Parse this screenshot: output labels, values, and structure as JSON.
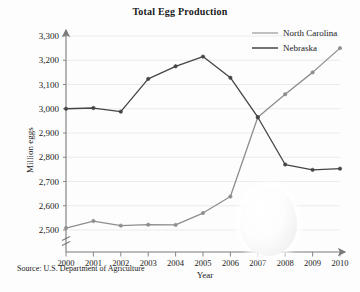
{
  "title": "Total Egg Production",
  "source_note": "Source: U.S. Department of Agriculture",
  "axes": {
    "xlabel": "Year",
    "ylabel": "Million eggs"
  },
  "legend": {
    "entries": [
      {
        "label": "North Carolina",
        "color": "#8e8e8e"
      },
      {
        "label": "Nebraska",
        "color": "#454545"
      }
    ]
  },
  "overlay": {
    "egg_shape": "egg-graphic"
  },
  "chart_data": {
    "type": "line",
    "title": "Total Egg Production",
    "xlabel": "Year",
    "ylabel": "Million eggs",
    "x": [
      2000,
      2001,
      2002,
      2003,
      2004,
      2005,
      2006,
      2007,
      2008,
      2009,
      2010
    ],
    "xtick_labels": [
      "2000",
      "2001",
      "2002",
      "2003",
      "2004",
      "2005",
      "2006",
      "2007",
      "2008",
      "2009",
      "2010"
    ],
    "ytick_labels": [
      "2,500",
      "2,600",
      "2,700",
      "2,800",
      "2,900",
      "3,000",
      "3,100",
      "3,200",
      "3,300"
    ],
    "yticks": [
      2500,
      2600,
      2700,
      2800,
      2900,
      3000,
      3100,
      3200,
      3300
    ],
    "ylim": [
      2500,
      3300
    ],
    "xlim": [
      2000,
      2010
    ],
    "axis_break": true,
    "grid": true,
    "legend_position": "top-right",
    "series": [
      {
        "name": "North Carolina",
        "color": "#8e8e8e",
        "values": [
          2508,
          2537,
          2518,
          2522,
          2521,
          2570,
          2638,
          2965,
          3060,
          3150,
          3250
        ]
      },
      {
        "name": "Nebraska",
        "color": "#454545",
        "values": [
          3000,
          3003,
          2988,
          3123,
          3175,
          3215,
          3128,
          2965,
          2770,
          2748,
          2753
        ]
      }
    ]
  }
}
